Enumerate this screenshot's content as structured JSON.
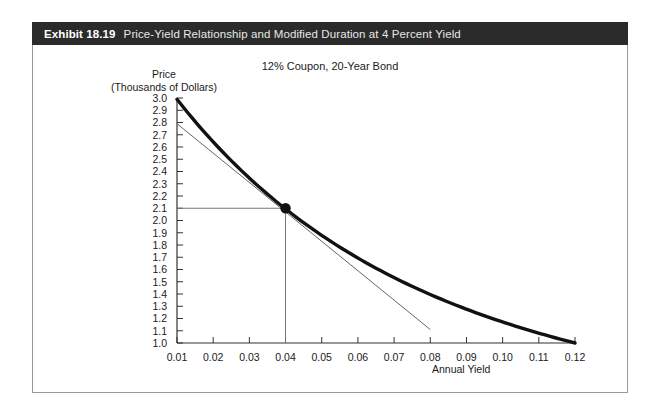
{
  "exhibit": {
    "number": "Exhibit 18.19",
    "caption": "Price-Yield Relationship and Modified Duration at 4 Percent Yield"
  },
  "chart_data": {
    "type": "line",
    "title": "12% Coupon, 20-Year Bond",
    "xlabel": "Annual Yield",
    "ylabel": "Price\n(Thousands of Dollars)",
    "ylabel_line1": "Price",
    "ylabel_line2": "(Thousands of Dollars)",
    "xlim": [
      0.01,
      0.12
    ],
    "ylim": [
      1.0,
      3.0
    ],
    "grid": false,
    "legend": "none",
    "xticks": [
      "0.01",
      "0.02",
      "0.03",
      "0.04",
      "0.05",
      "0.06",
      "0.07",
      "0.08",
      "0.09",
      "0.10",
      "0.11",
      "0.12"
    ],
    "xtick_values": [
      0.01,
      0.02,
      0.03,
      0.04,
      0.05,
      0.06,
      0.07,
      0.08,
      0.09,
      0.1,
      0.11,
      0.12
    ],
    "yticks": [
      "3.0",
      "2.9",
      "2.8",
      "2.7",
      "2.6",
      "2.5",
      "2.4",
      "2.3",
      "2.2",
      "2.1",
      "2.0",
      "1.9",
      "1.8",
      "1.7",
      "1.6",
      "1.5",
      "1.4",
      "1.3",
      "1.2",
      "1.1",
      "1.0"
    ],
    "ytick_values": [
      3.0,
      2.9,
      2.8,
      2.7,
      2.6,
      2.5,
      2.4,
      2.3,
      2.2,
      2.1,
      2.0,
      1.9,
      1.8,
      1.7,
      1.6,
      1.5,
      1.4,
      1.3,
      1.2,
      1.1,
      1.0
    ],
    "series": [
      {
        "name": "price-yield-curve",
        "style": "thick-convex-curve",
        "color": "#111111",
        "x": [
          0.01,
          0.015,
          0.02,
          0.025,
          0.03,
          0.035,
          0.04,
          0.045,
          0.05,
          0.055,
          0.06,
          0.065,
          0.07,
          0.075,
          0.08,
          0.085,
          0.09,
          0.095,
          0.1,
          0.105,
          0.11,
          0.115,
          0.12
        ],
        "values": [
          3.0,
          2.845,
          2.7,
          2.562,
          2.434,
          2.313,
          2.1,
          2.09,
          1.99,
          1.895,
          1.805,
          1.722,
          1.645,
          1.572,
          1.505,
          1.442,
          1.384,
          1.33,
          1.28,
          1.2,
          1.12,
          1.05,
          1.0
        ]
      },
      {
        "name": "modified-duration-tangent",
        "style": "thin-straight-line",
        "color": "#555555",
        "x": [
          0.01,
          0.08
        ],
        "values": [
          2.79,
          1.11
        ]
      }
    ],
    "annotations": [
      {
        "name": "tangency-point",
        "type": "marker",
        "x": 0.04,
        "y": 2.1,
        "label": ""
      },
      {
        "name": "horizontal-guide-line",
        "type": "guide",
        "from": [
          0.01,
          2.1
        ],
        "to": [
          0.04,
          2.1
        ]
      },
      {
        "name": "vertical-guide-line",
        "type": "guide",
        "from": [
          0.04,
          2.1
        ],
        "to": [
          0.04,
          1.0
        ]
      }
    ]
  }
}
